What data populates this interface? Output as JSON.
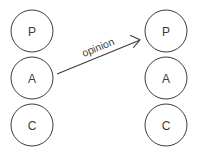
{
  "diagram": {
    "background_color": "#ffffff",
    "stroke_color": "#3c3c3c",
    "text_color": "#3a3a3a",
    "left_group": {
      "name": "left-stack",
      "center_x": 32,
      "radius": 21,
      "nodes": [
        {
          "label": "P",
          "cx": 32,
          "cy": 31
        },
        {
          "label": "A",
          "cx": 32,
          "cy": 78
        },
        {
          "label": "C",
          "cx": 32,
          "cy": 125
        }
      ]
    },
    "right_group": {
      "name": "right-stack",
      "center_x": 166,
      "radius": 21,
      "nodes": [
        {
          "label": "P",
          "cx": 166,
          "cy": 31
        },
        {
          "label": "A",
          "cx": 166,
          "cy": 78
        },
        {
          "label": "C",
          "cx": 166,
          "cy": 125
        }
      ]
    },
    "arrow": {
      "label": "opinion",
      "x1": 57,
      "y1": 74,
      "x2": 140,
      "y2": 40,
      "label_x": 98,
      "label_y": 47,
      "label_rotation": -22
    }
  }
}
